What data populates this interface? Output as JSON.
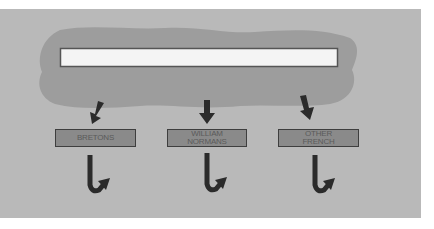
{
  "diagram": {
    "source_box_text": "",
    "groups": [
      {
        "label": "BRETONS"
      },
      {
        "label": "WILLIAM\nNORMANS"
      },
      {
        "label": "OTHER\nFRENCH"
      }
    ],
    "colors": {
      "background": "#ffffff",
      "panel": "#b9b9b9",
      "cloud": "#9d9d9d",
      "label_fill": "#8a8a8a",
      "arrow": "#2b2b2b"
    }
  }
}
